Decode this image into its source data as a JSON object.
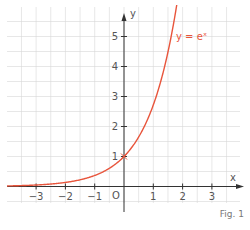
{
  "chart_data": {
    "type": "line",
    "title": "",
    "function": "y = e^x",
    "xlabel": "x",
    "ylabel": "y",
    "origin_label": "O",
    "xlim": [
      -4.0,
      3.9
    ],
    "ylim": [
      -0.55,
      6.0
    ],
    "x_ticks": [
      -3,
      -2,
      -1,
      1,
      2,
      3
    ],
    "y_ticks": [
      1,
      2,
      3,
      4,
      5
    ],
    "grid": true,
    "grid_step": 0.5,
    "series": [
      {
        "name": "y = eˣ",
        "color": "#e8553c",
        "x": [
          -4.0,
          -3.0,
          -2.0,
          -1.0,
          -0.5,
          0.0,
          0.5,
          1.0,
          1.25,
          1.5,
          1.75
        ],
        "y": [
          0.018,
          0.05,
          0.135,
          0.368,
          0.607,
          1.0,
          1.649,
          2.718,
          3.49,
          4.482,
          5.755
        ]
      }
    ],
    "annotations": [
      {
        "text": "y = eˣ",
        "x": 1.8,
        "y": 5.0,
        "color": "#e8553c"
      },
      {
        "text": "point (0, 1) marked on curve"
      }
    ]
  },
  "labels": {
    "x_axis": "x",
    "y_axis": "y",
    "origin": "O",
    "curve": "y = eˣ",
    "figure": "Fig. 1"
  },
  "colors": {
    "curve": "#e8553c",
    "axis": "#333333",
    "grid": "#d6d6d6",
    "text": "#555555"
  }
}
